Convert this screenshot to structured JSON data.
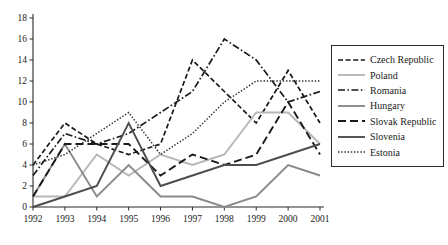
{
  "chart_data": {
    "type": "line",
    "title": "",
    "xlabel": "",
    "ylabel": "",
    "categories": [
      "1992",
      "1993",
      "1994",
      "1995",
      "1996",
      "1997",
      "1998",
      "1999",
      "2000",
      "2001"
    ],
    "x": [
      1992,
      1993,
      1994,
      1995,
      1996,
      1997,
      1998,
      1999,
      2000,
      2001
    ],
    "ylim": [
      0,
      18
    ],
    "xlim": [
      1992,
      2001
    ],
    "yticks": [
      0,
      2,
      4,
      6,
      8,
      10,
      12,
      14,
      16,
      18
    ],
    "ytick_labels": [
      "0",
      "2",
      "4",
      "6",
      "8",
      "10",
      "12",
      "14",
      "16",
      "18"
    ],
    "grid": false,
    "legend_position": "right",
    "series": [
      {
        "name": "Czech Republic",
        "values": [
          4,
          8,
          6,
          5,
          6,
          14,
          11,
          8,
          13,
          8
        ],
        "style": "dashed",
        "color": "#1a1a1a"
      },
      {
        "name": "Poland",
        "values": [
          1,
          1,
          5,
          3,
          5,
          4,
          5,
          9,
          9,
          6
        ],
        "style": "solid",
        "color": "#b7b7b7"
      },
      {
        "name": "Romania",
        "values": [
          3,
          7,
          6,
          7,
          9,
          11,
          16,
          14,
          10,
          11
        ],
        "style": "dashdot",
        "color": "#1a1a1a"
      },
      {
        "name": "Hungary",
        "values": [
          1,
          6,
          1,
          4,
          1,
          1,
          0,
          1,
          4,
          3
        ],
        "style": "solid",
        "color": "#8a8a8a"
      },
      {
        "name": "Slovak Republic",
        "values": [
          1,
          6,
          6,
          6,
          3,
          5,
          4,
          5,
          10,
          5
        ],
        "style": "longdash",
        "color": "#1a1a1a"
      },
      {
        "name": "Slovenia",
        "values": [
          0,
          1,
          2,
          8,
          2,
          3,
          4,
          4,
          5,
          6
        ],
        "style": "solid",
        "color": "#4d4d4d"
      },
      {
        "name": "Estonia",
        "values": [
          4,
          5,
          7,
          9,
          5,
          7,
          10,
          12,
          12,
          12
        ],
        "style": "dotted",
        "color": "#2b2b2b"
      }
    ]
  },
  "legend": {
    "items": [
      {
        "label": "Czech Republic"
      },
      {
        "label": "Poland"
      },
      {
        "label": "Romania"
      },
      {
        "label": "Hungary"
      },
      {
        "label": "Slovak Republic"
      },
      {
        "label": "Slovenia"
      },
      {
        "label": "Estonia"
      }
    ]
  }
}
